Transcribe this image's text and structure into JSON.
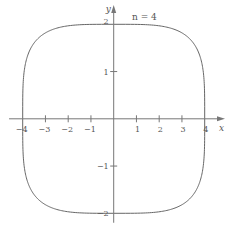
{
  "chart_data": {
    "type": "line",
    "title": "",
    "annotation": "n = 4",
    "equation": "|x/4|^n + |y/2|^n = 1",
    "n": 4,
    "a": 4,
    "b": 2,
    "xlabel": "x",
    "ylabel": "y",
    "xlim": [
      -4.6,
      4.7
    ],
    "ylim": [
      -2.2,
      2.35
    ],
    "xticks": [
      -4,
      -3,
      -2,
      -1,
      1,
      2,
      3,
      4
    ],
    "xtick_labels": [
      "−4",
      "−3",
      "−2",
      "−1",
      "1",
      "2",
      "3",
      "4"
    ],
    "yticks": [
      2,
      1,
      -1,
      -2
    ],
    "ytick_labels": [
      "2",
      "1",
      "−1",
      "−2"
    ],
    "grid": false,
    "legend": null,
    "colors": {
      "axis": "#777777",
      "curve": "#666666",
      "text": "#555555"
    }
  },
  "labels": {
    "x_axis": "x",
    "y_axis": "y",
    "annotation": "n = 4"
  }
}
